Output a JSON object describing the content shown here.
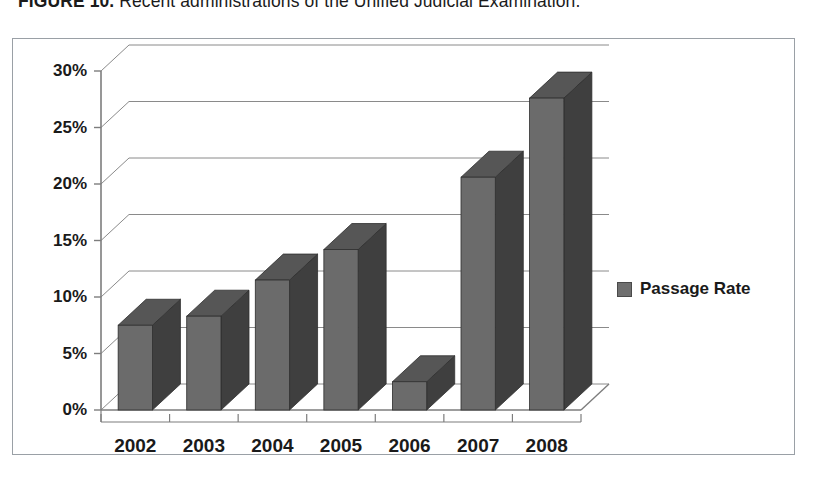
{
  "caption": {
    "figure_number": "FIGURE 10.",
    "text": "Recent administrations of the Unified Judicial Examination."
  },
  "legend": {
    "label": "Passage Rate",
    "swatch_color": "#6f6f6f",
    "position": "right"
  },
  "colors": {
    "bar_face": "#6b6b6b",
    "bar_top": "#565656",
    "bar_side": "#3f3f3f",
    "gridline": "#8a8a8a",
    "axis": "#7d7d7d",
    "border": "#9aa0a6",
    "text": "#1a1a1a",
    "plot_background": "#ffffff"
  },
  "chart_data": {
    "type": "bar",
    "title": "",
    "subtitle": "",
    "xlabel": "",
    "ylabel": "",
    "categories": [
      "2002",
      "2003",
      "2004",
      "2005",
      "2006",
      "2007",
      "2008"
    ],
    "values": [
      7.5,
      8.3,
      11.5,
      14.2,
      2.5,
      20.6,
      27.6
    ],
    "value_unit": "%",
    "series": [
      {
        "name": "Passage Rate",
        "values": [
          7.5,
          8.3,
          11.5,
          14.2,
          2.5,
          20.6,
          27.6
        ]
      }
    ],
    "ylim": [
      0,
      30
    ],
    "ytick_values": [
      0,
      5,
      10,
      15,
      20,
      25,
      30
    ],
    "ytick_labels": [
      "0%",
      "5%",
      "10%",
      "15%",
      "20%",
      "25%",
      "30%"
    ],
    "grid": true,
    "grid_axis": "y",
    "legend": true,
    "legend_position": "right",
    "three_d": true
  }
}
